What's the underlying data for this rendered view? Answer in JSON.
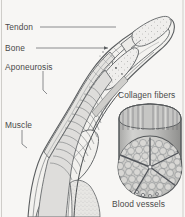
{
  "figure": {
    "background_color": "#f7f6f4",
    "line_color": "#55585a",
    "label_color": "#4a4a4a",
    "fill_light": "#e9e8e6",
    "fill_mid": "#c9c9c7",
    "fill_dark": "#9a9a98"
  },
  "labels": {
    "tendon": "Tendon",
    "bone": "Bone",
    "aponeurosis": "Aponeurosis",
    "muscle": "Muscle",
    "collagen_fibers": "Collagen fibers",
    "blood_vessels": "Blood vessels"
  },
  "structures": [
    {
      "name": "tendon",
      "label": "Tendon",
      "description": "Pale fibrous cord running along the dorsal side of the finger toward the distal phalanx"
    },
    {
      "name": "bone",
      "label": "Bone",
      "description": "Phalanx bones shown in sectional stipple within the digit"
    },
    {
      "name": "aponeurosis",
      "label": "Aponeurosis",
      "description": "Flat sheet-like tendon expansion along the muscle surface"
    },
    {
      "name": "muscle",
      "label": "Muscle",
      "description": "Striated muscle belly with oblique fiber bundles filling the proximal region"
    },
    {
      "name": "collagen-fibers",
      "label": "Collagen fibers",
      "description": "Longitudinal fibers forming the wall of the cut cylinder in the inset"
    },
    {
      "name": "blood-vessels",
      "label": "Blood vessels",
      "description": "Vessels within the radial septa of the fascicle cross section"
    }
  ],
  "inset": {
    "name": "collagen-bundle-inset",
    "shape": "cut cylinder with circular cross section",
    "fascicle_count_visible": 60,
    "septa_count": 5
  }
}
